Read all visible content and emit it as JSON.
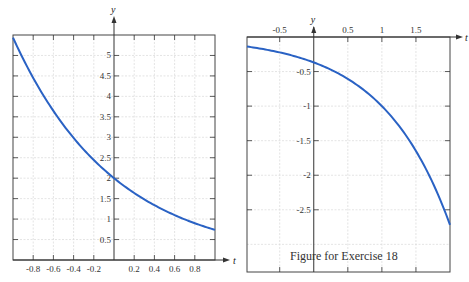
{
  "caption": "Figure for Exercise 18",
  "colors": {
    "curve": "#2a62c4",
    "grid": "#d9d9d9",
    "axis": "#333333",
    "frame": "#444444"
  },
  "chart_data": [
    {
      "type": "line",
      "title": "",
      "xlabel": "t",
      "ylabel": "y",
      "xlim": [
        -1,
        1
      ],
      "ylim": [
        0,
        5.5
      ],
      "grid": true,
      "xticks": [
        "-0.8",
        "-0.6",
        "-0.4",
        "-0.2",
        "0.2",
        "0.4",
        "0.6",
        "0.8"
      ],
      "yticks": [
        "0.5",
        "1",
        "1.5",
        "2",
        "2.5",
        "3",
        "3.5",
        "4",
        "4.5",
        "5"
      ],
      "series": [
        {
          "name": "solution curve",
          "x": [
            -1,
            -0.8,
            -0.6,
            -0.4,
            -0.2,
            0,
            0.2,
            0.4,
            0.6,
            0.8,
            1
          ],
          "y": [
            5.44,
            4.45,
            3.64,
            2.98,
            2.44,
            2.0,
            1.64,
            1.34,
            1.1,
            0.9,
            0.74
          ]
        }
      ]
    },
    {
      "type": "line",
      "title": "",
      "xlabel": "t",
      "ylabel": "y",
      "xlim": [
        -1,
        2
      ],
      "ylim": [
        -3.4,
        0
      ],
      "grid": true,
      "xticks": [
        "-0.5",
        "0.5",
        "1",
        "1.5"
      ],
      "yticks": [
        "-0.5",
        "-1",
        "-1.5",
        "-2",
        "-2.5"
      ],
      "series": [
        {
          "name": "solution curve",
          "x": [
            -1,
            -0.5,
            0,
            0.5,
            1,
            1.5,
            2
          ],
          "y": [
            -0.14,
            -0.22,
            -0.37,
            -0.61,
            -1.0,
            -1.65,
            -2.72
          ]
        }
      ]
    }
  ]
}
